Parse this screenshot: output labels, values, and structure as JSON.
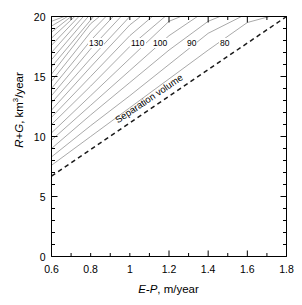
{
  "figure": {
    "kind": "contour-plot"
  },
  "axes": {
    "x": {
      "label_italic": "E-P",
      "label_rest": ", m/year",
      "ticks": [
        "0.6",
        "0.8",
        "1",
        "1.2",
        "1.4",
        "1.6",
        "1.8"
      ]
    },
    "y": {
      "label_italic": "R+G",
      "label_rest": ", km",
      "label_sup": "3",
      "label_tail": "/year",
      "ticks": [
        "0",
        "5",
        "10",
        "15",
        "20"
      ]
    }
  },
  "annotations": {
    "separation_volume": "Separation volume"
  },
  "contour_labels": [
    {
      "text": "130",
      "x": 88,
      "y": 38
    },
    {
      "text": "110",
      "x": 130,
      "y": 38
    },
    {
      "text": "100",
      "x": 152,
      "y": 38
    },
    {
      "text": "90",
      "x": 186,
      "y": 38
    },
    {
      "text": "80",
      "x": 219,
      "y": 38
    }
  ],
  "colors": {
    "contour": "#8c8c8c",
    "axis": "#000000",
    "dashed": "#1a1a1a",
    "background": "#ffffff"
  },
  "chart_data": {
    "type": "line",
    "title": "",
    "xlabel": "E-P, m/year",
    "ylabel": "R+G, km3/year",
    "xlim": [
      0.6,
      1.8
    ],
    "ylim": [
      0,
      20
    ],
    "grid": false,
    "legend": "none",
    "x_ticks": [
      0.6,
      0.8,
      1.0,
      1.2,
      1.4,
      1.6,
      1.8
    ],
    "y_ticks": [
      0,
      5,
      10,
      15,
      20
    ],
    "x_minor_step": 0.1,
    "y_minor_step": 1,
    "contour_levels": [
      80,
      90,
      100,
      110,
      130
    ],
    "labelled_contours": [
      {
        "level": 130,
        "label_at": {
          "x": 0.79,
          "y": 18.6
        }
      },
      {
        "level": 110,
        "label_at": {
          "x": 1.01,
          "y": 18.6
        }
      },
      {
        "level": 100,
        "label_at": {
          "x": 1.12,
          "y": 18.6
        }
      },
      {
        "level": 90,
        "label_at": {
          "x": 1.29,
          "y": 18.6
        }
      },
      {
        "level": 80,
        "label_at": {
          "x": 1.46,
          "y": 18.6
        }
      }
    ],
    "series": [
      {
        "name": "contour-80",
        "x": [
          0.6,
          0.8,
          1.0,
          1.2,
          1.4,
          1.6,
          1.713
        ],
        "y": [
          7.6,
          10.0,
          12.4,
          14.8,
          17.2,
          19.5,
          20.0
        ]
      },
      {
        "name": "contour-85",
        "x": [
          0.6,
          0.8,
          1.0,
          1.2,
          1.4,
          1.57
        ],
        "y": [
          8.3,
          10.9,
          13.4,
          16.0,
          18.6,
          20.0
        ]
      },
      {
        "name": "contour-90",
        "x": [
          0.6,
          0.8,
          1.0,
          1.2,
          1.4,
          1.46
        ],
        "y": [
          9.0,
          11.8,
          14.5,
          17.2,
          19.6,
          20.0
        ]
      },
      {
        "name": "contour-95",
        "x": [
          0.6,
          0.8,
          1.0,
          1.2,
          1.345
        ],
        "y": [
          9.7,
          12.6,
          15.5,
          18.4,
          20.0
        ]
      },
      {
        "name": "contour-100",
        "x": [
          0.6,
          0.8,
          1.0,
          1.2,
          1.26
        ],
        "y": [
          10.3,
          13.4,
          16.5,
          19.6,
          20.0
        ]
      },
      {
        "name": "contour-105",
        "x": [
          0.6,
          0.8,
          1.0,
          1.18
        ],
        "y": [
          11.0,
          14.2,
          17.5,
          20.0
        ]
      },
      {
        "name": "contour-110",
        "x": [
          0.6,
          0.8,
          1.0,
          1.115
        ],
        "y": [
          11.6,
          15.0,
          18.4,
          20.0
        ]
      },
      {
        "name": "contour-115",
        "x": [
          0.6,
          0.8,
          1.0,
          1.055
        ],
        "y": [
          12.2,
          15.8,
          19.3,
          20.0
        ]
      },
      {
        "name": "contour-120",
        "x": [
          0.6,
          0.8,
          1.0
        ],
        "y": [
          12.8,
          16.5,
          20.0
        ]
      },
      {
        "name": "contour-125",
        "x": [
          0.6,
          0.8,
          0.955
        ],
        "y": [
          13.4,
          17.3,
          20.0
        ]
      },
      {
        "name": "contour-130",
        "x": [
          0.6,
          0.8,
          0.915
        ],
        "y": [
          14.0,
          18.0,
          20.0
        ]
      },
      {
        "name": "contour-135",
        "x": [
          0.6,
          0.8,
          0.878
        ],
        "y": [
          14.6,
          18.7,
          20.0
        ]
      },
      {
        "name": "contour-140",
        "x": [
          0.6,
          0.8,
          0.845
        ],
        "y": [
          15.2,
          19.4,
          20.0
        ]
      },
      {
        "name": "contour-145",
        "x": [
          0.6,
          0.815
        ],
        "y": [
          15.8,
          20.0
        ]
      },
      {
        "name": "contour-150",
        "x": [
          0.6,
          0.788
        ],
        "y": [
          16.4,
          20.0
        ]
      },
      {
        "name": "contour-155",
        "x": [
          0.6,
          0.763
        ],
        "y": [
          17.0,
          20.0
        ]
      },
      {
        "name": "contour-160",
        "x": [
          0.6,
          0.74
        ],
        "y": [
          17.6,
          20.0
        ]
      },
      {
        "name": "contour-165",
        "x": [
          0.6,
          0.719
        ],
        "y": [
          18.2,
          20.0
        ]
      },
      {
        "name": "contour-170",
        "x": [
          0.6,
          0.7
        ],
        "y": [
          18.7,
          20.0
        ]
      },
      {
        "name": "contour-175",
        "x": [
          0.6,
          0.682
        ],
        "y": [
          19.2,
          20.0
        ]
      },
      {
        "name": "contour-180",
        "x": [
          0.6,
          0.665
        ],
        "y": [
          19.6,
          20.0
        ]
      },
      {
        "name": "separation-volume",
        "style": "dashed",
        "x": [
          0.6,
          1.8
        ],
        "y": [
          6.7,
          20.0
        ]
      }
    ]
  }
}
